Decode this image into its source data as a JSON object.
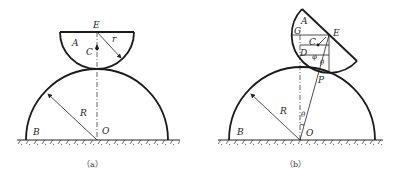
{
  "figure_a": {
    "caption": "（a）",
    "labels": {
      "E": "E",
      "A": "A",
      "C": "C",
      "r": "r",
      "R": "R",
      "B": "B",
      "O": "O"
    }
  },
  "figure_b": {
    "caption": "（b）",
    "labels": {
      "A": "A",
      "G": "G",
      "E": "E",
      "C": "C",
      "D": "D",
      "phi": "φ",
      "theta_top": "θ",
      "P": "P",
      "R": "R",
      "theta_bottom": "θ",
      "B": "B",
      "O": "O"
    }
  }
}
